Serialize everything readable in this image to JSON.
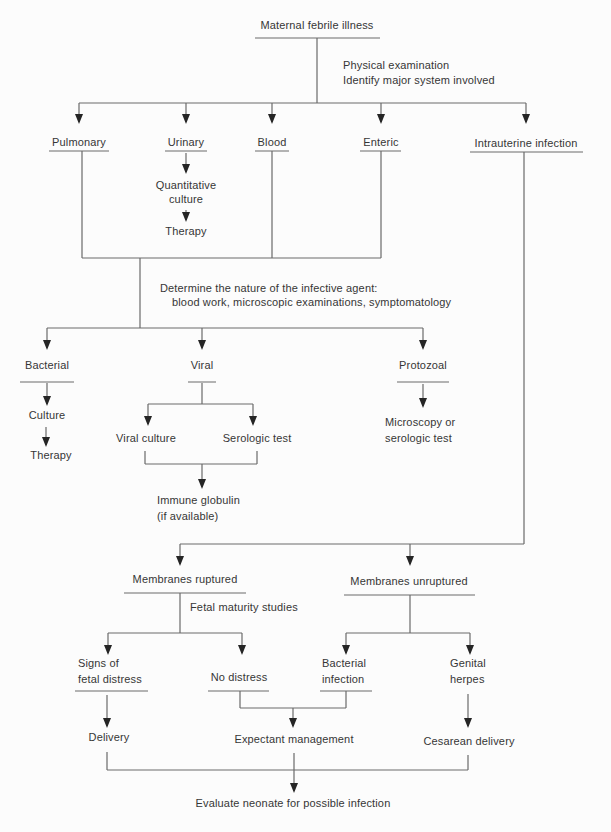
{
  "figure": {
    "title": "Maternal febrile illness",
    "annotation": {
      "line1": "Physical examination",
      "line2": "Identify major system involved"
    },
    "systems": {
      "pulmonary": "Pulmonary",
      "urinary": "Urinary",
      "blood": "Blood",
      "enteric": "Enteric",
      "intrauterine": "Intrauterine infection"
    },
    "urinary_chain": {
      "quantitative_line1": "Quantitative",
      "quantitative_line2": "culture",
      "therapy": "Therapy"
    },
    "determine": {
      "line1": "Determine the nature of the infective agent:",
      "line2": "blood work, microscopic examinations, symptomatology"
    },
    "agents": {
      "bacterial": "Bacterial",
      "viral": "Viral",
      "protozoal": "Protozoal"
    },
    "bacterial_chain": {
      "culture": "Culture",
      "therapy": "Therapy"
    },
    "viral_chain": {
      "viral_culture": "Viral culture",
      "serologic_test": "Serologic test",
      "immune_line1": "Immune globulin",
      "immune_line2": "(if available)"
    },
    "protozoal_chain": {
      "line1": "Microscopy or",
      "line2": "serologic test"
    },
    "membranes": {
      "ruptured": "Membranes ruptured",
      "unruptured": "Membranes unruptured",
      "fetal_maturity": "Fetal maturity studies"
    },
    "outcomes": {
      "signs_line1": "Signs of",
      "signs_line2": "fetal distress",
      "no_distress": "No distress",
      "bacterial_infection_line1": "Bacterial",
      "bacterial_infection_line2": "infection",
      "genital_line1": "Genital",
      "genital_line2": "herpes"
    },
    "actions": {
      "delivery": "Delivery",
      "expectant": "Expectant management",
      "cesarean": "Cesarean delivery",
      "evaluate": "Evaluate neonate for possible infection"
    },
    "colors": {
      "background": "#fcfcfc",
      "line": "#6a6a6a",
      "arrow": "#252525",
      "text": "#363636"
    }
  }
}
